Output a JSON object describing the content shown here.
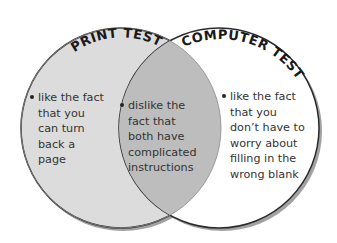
{
  "diagram": {
    "type": "venn",
    "colors": {
      "left_fill": "#dcdcdc",
      "right_fill": "#ffffff",
      "overlap_fill": "#bdbdbd",
      "stroke": "#2a2a2a",
      "text": "#333333"
    },
    "left": {
      "title": "PRINT TEST",
      "items": [
        {
          "lines": [
            "like the fact",
            "that you",
            "can turn",
            "back a",
            "page"
          ]
        }
      ]
    },
    "right": {
      "title": "COMPUTER TEST",
      "items": [
        {
          "lines": [
            "like the fact",
            "that you",
            "don’t have to",
            "worry about",
            "filling in the",
            "wrong blank"
          ]
        }
      ]
    },
    "overlap": {
      "items": [
        {
          "lines": [
            "dislike the",
            "fact that",
            "both have",
            "complicated",
            "instructions"
          ]
        }
      ]
    }
  }
}
